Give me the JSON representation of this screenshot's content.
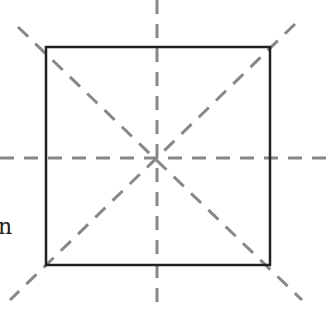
{
  "diagram": {
    "square": {
      "left": 46,
      "top": 47,
      "right": 270,
      "bottom": 265,
      "stroke": "#222222"
    },
    "center": {
      "x": 157,
      "y": 158
    },
    "symmetry_lines": [
      {
        "name": "horizontal",
        "x1": 0,
        "y1": 158,
        "x2": 327,
        "y2": 158
      },
      {
        "name": "vertical",
        "x1": 157,
        "y1": 0,
        "x2": 157,
        "y2": 312
      },
      {
        "name": "diagonal-main",
        "x1": 18,
        "y1": 27,
        "x2": 302,
        "y2": 300
      },
      {
        "name": "diagonal-anti",
        "x1": 295,
        "y1": 24,
        "x2": 10,
        "y2": 300
      }
    ],
    "dash_color": "#888888",
    "text_fragment": "n"
  }
}
